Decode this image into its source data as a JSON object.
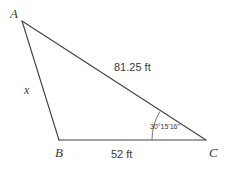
{
  "diagram": {
    "type": "triangle",
    "vertices": [
      {
        "name": "A",
        "label": "A",
        "x": 22,
        "y": 21
      },
      {
        "name": "B",
        "label": "B",
        "x": 59,
        "y": 140
      },
      {
        "name": "C",
        "label": "C",
        "x": 206,
        "y": 140
      }
    ],
    "sides": [
      {
        "name": "side-ac",
        "label": "81.25 ft",
        "from": "A",
        "to": "C"
      },
      {
        "name": "side-bc",
        "label": "52 ft",
        "from": "B",
        "to": "C"
      },
      {
        "name": "side-ab",
        "label": "x",
        "from": "A",
        "to": "B"
      }
    ],
    "angles": [
      {
        "name": "angle-c",
        "at": "C",
        "label": "30°15'16\""
      }
    ],
    "style": {
      "stroke": "#444444",
      "background": "#ffffff",
      "text": "#3a3a3a"
    }
  }
}
